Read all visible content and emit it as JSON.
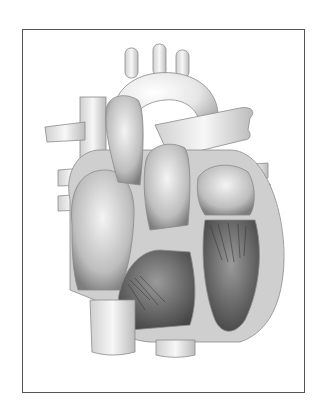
{
  "figure": {
    "style": "grayscale pencil illustration",
    "frame": {
      "border_color": "#555555",
      "background": "#ffffff"
    },
    "palette": {
      "light": "#f2f2f2",
      "mid": "#cfcfcf",
      "dark": "#6b6b6b",
      "muscle": "#bdbdbd",
      "outline": "#7a7a7a"
    }
  }
}
